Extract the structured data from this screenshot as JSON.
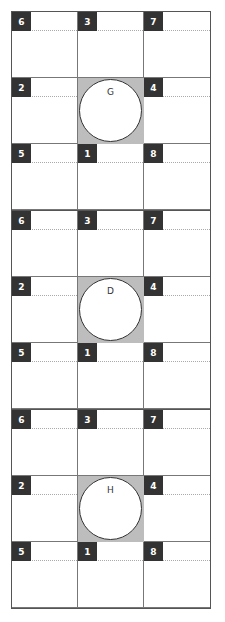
{
  "diagram": {
    "colors": {
      "badge": "#333333",
      "hub_fill": "#bdbdbd",
      "grid_line": "#777777",
      "border": "#555555"
    },
    "cell_numbers_layout": [
      [
        "6",
        "3",
        "7"
      ],
      [
        "2",
        null,
        "4"
      ],
      [
        "5",
        "1",
        "8"
      ]
    ],
    "blocks": [
      {
        "center_label": "G",
        "cells": {
          "top_left": "6",
          "top_center": "3",
          "top_right": "7",
          "middle_left": "2",
          "middle_right": "4",
          "bottom_left": "5",
          "bottom_center": "1",
          "bottom_right": "8"
        }
      },
      {
        "center_label": "D",
        "cells": {
          "top_left": "6",
          "top_center": "3",
          "top_right": "7",
          "middle_left": "2",
          "middle_right": "4",
          "bottom_left": "5",
          "bottom_center": "1",
          "bottom_right": "8"
        }
      },
      {
        "center_label": "H",
        "cells": {
          "top_left": "6",
          "top_center": "3",
          "top_right": "7",
          "middle_left": "2",
          "middle_right": "4",
          "bottom_left": "5",
          "bottom_center": "1",
          "bottom_right": "8"
        }
      }
    ]
  }
}
